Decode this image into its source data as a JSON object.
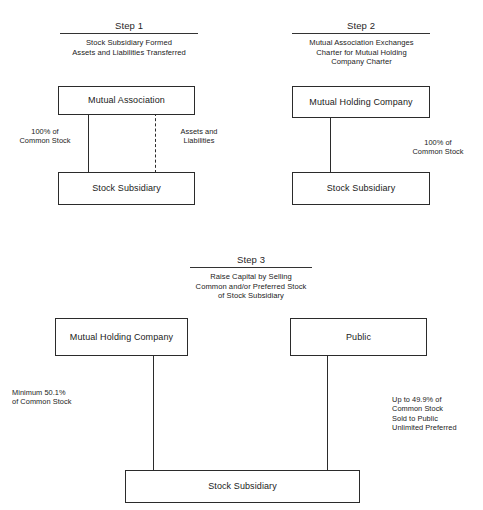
{
  "diagram": {
    "background_color": "#ffffff",
    "line_color": "#2b2b2b",
    "text_color": "#1a1a1a"
  },
  "steps": [
    {
      "id": "step-1",
      "title": "Step 1",
      "description_lines": [
        "Stock Subsidiary Formed",
        "Assets and Liabilities Transferred"
      ],
      "boxes": [
        {
          "id": "mutual-association",
          "label": "Mutual Association"
        },
        {
          "id": "stock-subsidiary",
          "label": "Stock Subsidiary"
        }
      ],
      "connectors": [
        {
          "id": "common-stock-connector",
          "style": "solid",
          "label_lines": [
            "100% of",
            "Common Stock"
          ]
        },
        {
          "id": "assets-liabilities-connector",
          "style": "dashed",
          "label_lines": [
            "Assets and",
            "Liabilities"
          ]
        }
      ]
    },
    {
      "id": "step-2",
      "title": "Step 2",
      "description_lines": [
        "Mutual Association Exchanges",
        "Charter for Mutual Holding",
        "Company Charter"
      ],
      "boxes": [
        {
          "id": "mutual-holding-company",
          "label": "Mutual Holding Company"
        },
        {
          "id": "stock-subsidiary",
          "label": "Stock Subsidiary"
        }
      ],
      "connectors": [
        {
          "id": "common-stock-connector",
          "style": "solid",
          "label_lines": [
            "100% of",
            "Common Stock"
          ]
        }
      ]
    },
    {
      "id": "step-3",
      "title": "Step 3",
      "description_lines": [
        "Raise Capital by Selling",
        "Common and/or Preferred Stock",
        "of Stock Subsidiary"
      ],
      "boxes": [
        {
          "id": "mutual-holding-company",
          "label": "Mutual Holding Company"
        },
        {
          "id": "public",
          "label": "Public"
        },
        {
          "id": "stock-subsidiary",
          "label": "Stock Subsidiary"
        }
      ],
      "connectors": [
        {
          "id": "mhc-ownership-connector",
          "style": "solid",
          "label_lines": [
            "Minimum 50.1%",
            "of Common Stock"
          ]
        },
        {
          "id": "public-ownership-connector",
          "style": "solid",
          "label_lines": [
            "Up to 49.9% of",
            "Common Stock",
            "Sold to Public",
            "Unlimited Preferred"
          ]
        }
      ]
    }
  ],
  "text": {
    "step1": {
      "title": "Step 1",
      "desc_l1": "Stock Subsidiary Formed",
      "desc_l2": "Assets and Liabilities Transferred",
      "box_top": "Mutual Association",
      "box_bottom": "Stock Subsidiary",
      "note_left_l1": "100% of",
      "note_left_l2": "Common Stock",
      "note_right_l1": "Assets and",
      "note_right_l2": "Liabilities"
    },
    "step2": {
      "title": "Step 2",
      "desc_l1": "Mutual Association Exchanges",
      "desc_l2": "Charter for Mutual Holding",
      "desc_l3": "Company Charter",
      "box_top": "Mutual Holding Company",
      "box_bottom": "Stock Subsidiary",
      "note_right_l1": "100% of",
      "note_right_l2": "Common Stock"
    },
    "step3": {
      "title": "Step 3",
      "desc_l1": "Raise Capital by Selling",
      "desc_l2": "Common and/or Preferred Stock",
      "desc_l3": "of Stock Subsidiary",
      "box_left": "Mutual Holding Company",
      "box_right": "Public",
      "box_bottom": "Stock Subsidiary",
      "note_left_l1": "Minimum 50.1%",
      "note_left_l2": "of Common Stock",
      "note_right_l1": "Up to 49.9% of",
      "note_right_l2": "Common Stock",
      "note_right_l3": "Sold to Public",
      "note_right_l4": "Unlimited Preferred"
    }
  }
}
